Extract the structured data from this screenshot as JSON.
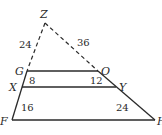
{
  "diagram": {
    "vertices": {
      "Z": "Z",
      "G": "G",
      "O": "O",
      "X": "X",
      "Y": "Y",
      "F": "F",
      "bottom_right": "H"
    },
    "segment_lengths": {
      "ZG": "24",
      "ZO": "36",
      "GX": "8",
      "OY": "12",
      "XF": "16",
      "YH": "24"
    },
    "notes": {
      "dashed_segments": [
        "ZG",
        "ZO"
      ],
      "parallel_segments": [
        "GO",
        "XY",
        "FH"
      ]
    }
  }
}
